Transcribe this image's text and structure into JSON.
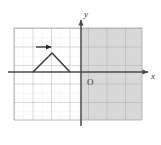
{
  "figure": {
    "axis_labels": {
      "x": "x",
      "y": "y",
      "origin": "O"
    },
    "colors": {
      "background": "#ffffff",
      "grid_minor": "#c9c9c9",
      "grid_major": "#9a9a9a",
      "axis": "#4a4a4a",
      "shape": "#3a3a3a",
      "arrow": "#2e2e2e",
      "shaded_region": "#d8d8d8",
      "label_text": "#3a3a3a"
    },
    "grid": {
      "x_min_px": 14,
      "x_max_px": 142,
      "y_min_px": 28,
      "y_max_px": 120,
      "cell_px": 18.5,
      "minor_divisions_per_cell": 2,
      "columns": 7,
      "rows": 5,
      "grid_on": true
    },
    "axes": {
      "origin_px": {
        "x": 81,
        "y": 72
      },
      "x_axis_y_px": 72,
      "y_axis_x_px": 81,
      "x_arrow_end_px": 150,
      "y_arrow_end_px": 16,
      "x_label_px": {
        "x": 153,
        "y": 78
      },
      "y_label_px": {
        "x": 85,
        "y": 16
      },
      "origin_label_px": {
        "x": 86,
        "y": 84
      }
    },
    "shaded_region": {
      "description": "right-half-plane-shading",
      "x_start_px": 81,
      "x_end_px": 142,
      "y_start_px": 28,
      "y_end_px": 120
    },
    "shape": {
      "name": "triangle",
      "vertices_px": [
        {
          "x": 33,
          "y": 72
        },
        {
          "x": 52,
          "y": 53
        },
        {
          "x": 70,
          "y": 72
        }
      ],
      "closed": false,
      "fill": "none"
    },
    "translation_arrow": {
      "name": "rightward-translation-arrow",
      "start_px": {
        "x": 36,
        "y": 47
      },
      "end_px": {
        "x": 53,
        "y": 47
      },
      "direction": "right",
      "head": "filled-arrowhead"
    }
  }
}
